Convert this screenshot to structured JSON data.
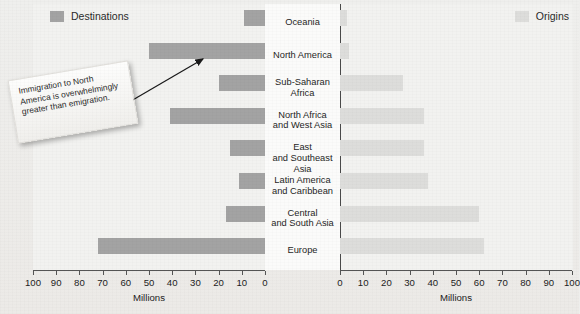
{
  "figure": {
    "title": "",
    "axis_title": "Millions"
  },
  "legend": {
    "destinations": {
      "label": "Destinations",
      "color": "#a3a3a3"
    },
    "origins": {
      "label": "Origins",
      "color": "#dddddb"
    }
  },
  "callout": {
    "text": "Immigration to North America is overwhelmingly greater than emigration."
  },
  "axes": {
    "left": {
      "title": "Millions",
      "ticks": [
        100,
        90,
        80,
        70,
        60,
        50,
        40,
        30,
        20,
        10,
        0
      ],
      "min": 0,
      "max": 100,
      "direction": "reversed"
    },
    "right": {
      "title": "Millions",
      "ticks": [
        0,
        10,
        20,
        30,
        40,
        50,
        60,
        70,
        80,
        90,
        100
      ],
      "min": 0,
      "max": 100,
      "direction": "normal"
    }
  },
  "chart_data": {
    "type": "bar",
    "title": "",
    "subtitle": "",
    "xlabel": "Millions",
    "ylabel": "",
    "xlim": [
      0,
      100
    ],
    "grid": false,
    "legend_position": "top",
    "orientation": "horizontal-diverging",
    "categories": [
      "Oceania",
      "North America",
      "Sub-Saharan Africa",
      "North Africa and West Asia",
      "East and Southeast Asia",
      "Latin America and Caribbean",
      "Central and South Asia",
      "Europe"
    ],
    "series": [
      {
        "name": "Destinations",
        "side": "left",
        "color": "#a3a3a3",
        "values": [
          9,
          50,
          20,
          41,
          15,
          11,
          17,
          72
        ]
      },
      {
        "name": "Origins",
        "side": "right",
        "color": "#dddddb",
        "values": [
          3,
          4,
          27,
          36,
          36,
          38,
          60,
          62
        ]
      }
    ],
    "annotations": [
      {
        "text": "Immigration to North America is overwhelmingly greater than emigration.",
        "points_to": "North America"
      }
    ]
  }
}
